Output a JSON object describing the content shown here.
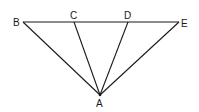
{
  "diagram": {
    "type": "geometry",
    "points": {
      "A": {
        "label": "A",
        "x": 100,
        "y": 95
      },
      "B": {
        "label": "B",
        "x": 23,
        "y": 22
      },
      "C": {
        "label": "C",
        "x": 74,
        "y": 22
      },
      "D": {
        "label": "D",
        "x": 128,
        "y": 22
      },
      "E": {
        "label": "E",
        "x": 179,
        "y": 22
      }
    },
    "segments": [
      {
        "from": "B",
        "to": "E"
      },
      {
        "from": "A",
        "to": "B"
      },
      {
        "from": "A",
        "to": "C"
      },
      {
        "from": "A",
        "to": "D"
      },
      {
        "from": "A",
        "to": "E"
      }
    ],
    "labels": {
      "A": "A",
      "B": "B",
      "C": "C",
      "D": "D",
      "E": "E"
    },
    "line_color": "#1a1a1a",
    "background": "#ffffff"
  }
}
